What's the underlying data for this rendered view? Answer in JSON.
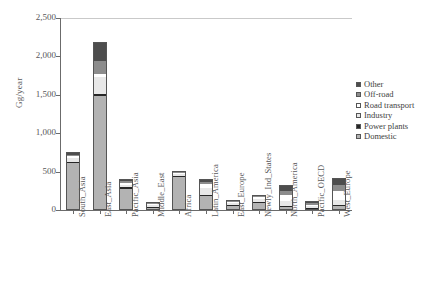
{
  "chart_data": {
    "type": "bar",
    "subtype": "stacked-bar",
    "title": "",
    "xlabel": "",
    "ylabel": "Gg/year",
    "ylim": [
      0,
      2500
    ],
    "yticks": [
      0,
      500,
      1000,
      1500,
      2000,
      2500
    ],
    "ytick_labels": [
      "0",
      "500",
      "1,000",
      "1,500",
      "2,000",
      "2,500"
    ],
    "grid": false,
    "legend_position": "right",
    "categories": [
      "South_Asia",
      "East_Asia",
      "Pacific_Asia",
      "Middle_East",
      "Africa",
      "Latin_America",
      "East_Europe",
      "Newly_Ind_States",
      "North_America",
      "Pacific_OECD",
      "West_Europe"
    ],
    "series": [
      {
        "name": "Domestic",
        "color": "#b3b3b3",
        "values": [
          610,
          1490,
          280,
          30,
          430,
          180,
          55,
          95,
          40,
          15,
          55
        ]
      },
      {
        "name": "Power plants",
        "color": "#262626",
        "values": [
          20,
          20,
          10,
          3,
          10,
          10,
          5,
          10,
          10,
          5,
          10
        ]
      },
      {
        "name": "Industry",
        "color": "#e8e8e8",
        "values": [
          45,
          220,
          35,
          5,
          20,
          90,
          15,
          30,
          60,
          15,
          60
        ]
      },
      {
        "name": "Road transport",
        "color": "#ffffff",
        "values": [
          25,
          45,
          25,
          8,
          15,
          55,
          10,
          25,
          85,
          25,
          120
        ]
      },
      {
        "name": "Off-road",
        "color": "#8c8c8c",
        "values": [
          20,
          170,
          20,
          4,
          10,
          30,
          8,
          15,
          45,
          20,
          75
        ]
      },
      {
        "name": "Other",
        "color": "#4d4d4d",
        "values": [
          35,
          240,
          25,
          5,
          15,
          40,
          12,
          20,
          75,
          25,
          90
        ]
      }
    ],
    "totals": [
      755,
      2185,
      395,
      55,
      500,
      405,
      105,
      195,
      315,
      105,
      410
    ],
    "legend_order": [
      "Other",
      "Off-road",
      "Road transport",
      "Industry",
      "Power plants",
      "Domestic"
    ]
  }
}
